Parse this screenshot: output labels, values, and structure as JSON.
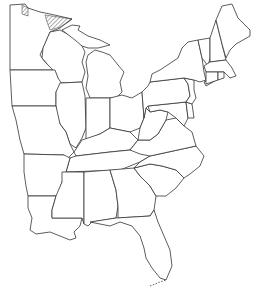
{
  "map": {
    "title": "Outline map of the eastern United States",
    "region": "Eastern United States",
    "shaded_area": "Northeastern Minnesota / Lake Superior shore (hatched)",
    "states": [
      "Minnesota",
      "Wisconsin",
      "Michigan",
      "Iowa",
      "Illinois",
      "Indiana",
      "Ohio",
      "Missouri",
      "Kentucky",
      "Tennessee",
      "Arkansas",
      "Louisiana",
      "Mississippi",
      "Alabama",
      "Georgia",
      "Florida",
      "South Carolina",
      "North Carolina",
      "Virginia",
      "West Virginia",
      "Maryland",
      "Delaware",
      "Pennsylvania",
      "New Jersey",
      "New York",
      "Connecticut",
      "Rhode Island",
      "Massachusetts",
      "Vermont",
      "New Hampshire",
      "Maine"
    ],
    "line_color": "#333333",
    "hatch_color": "#555555"
  },
  "caption": {
    "text": ""
  }
}
